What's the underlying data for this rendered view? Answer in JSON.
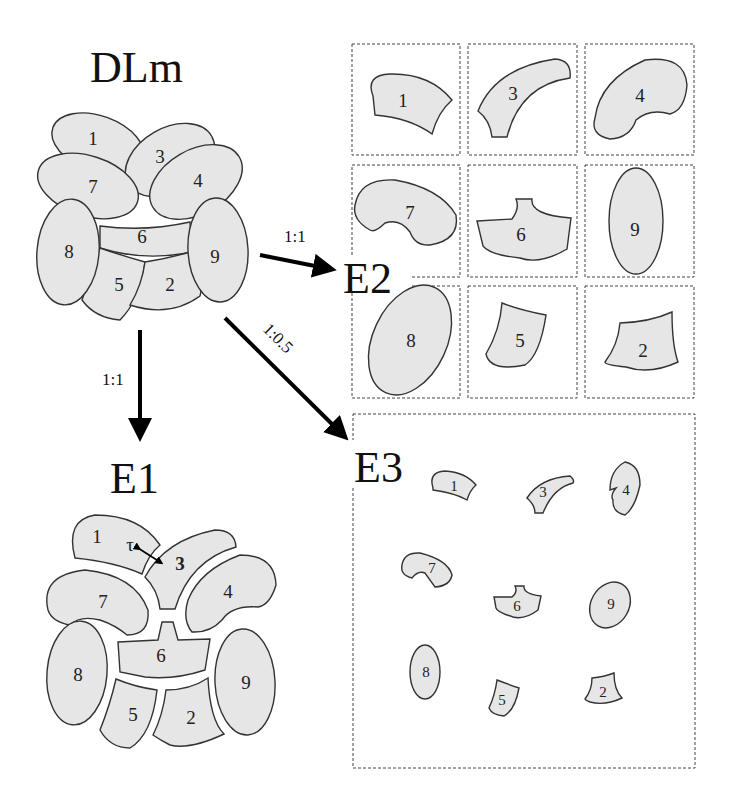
{
  "titles": {
    "source": "DLm",
    "e1": "E1",
    "e2": "E2",
    "e3": "E3"
  },
  "arrows": {
    "to_e1_ratio": "1:1",
    "to_e2_ratio": "1:1",
    "to_e3_ratio": "1:0.5"
  },
  "annotation": {
    "tau": "τ",
    "tau_target": "3"
  },
  "pieces": {
    "p1": "1",
    "p2": "2",
    "p3": "3",
    "p4": "4",
    "p5": "5",
    "p6": "6",
    "p7": "7",
    "p8": "8",
    "p9": "9"
  },
  "colors": {
    "piece_fill": "#e6e6e6",
    "stroke": "#333333"
  }
}
